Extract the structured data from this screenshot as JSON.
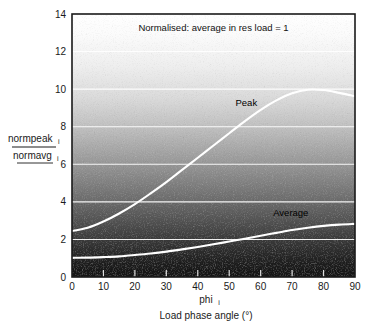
{
  "chart_data": {
    "type": "line",
    "title": "Normalised: average in res load = 1",
    "xlabel": "Load phase angle (°)",
    "xlabel_symbol": "phi",
    "xlabel_symbol_sub": "i",
    "ylabel_numerator": "normpeak",
    "ylabel_numerator_sub": "i",
    "ylabel_denominator": "normavg",
    "ylabel_denominator_sub": "i",
    "xlim": [
      0,
      90
    ],
    "ylim": [
      0,
      14
    ],
    "xticks": [
      "0",
      "10",
      "20",
      "30",
      "40",
      "50",
      "60",
      "70",
      "80",
      "90"
    ],
    "yticks": [
      "0",
      "2",
      "4",
      "6",
      "8",
      "10",
      "12",
      "14"
    ],
    "grid": "horizontal-white",
    "legend_position": "inline-annotation",
    "background": "vertical-grayscale-gradient-dark-bottom-light-top-with-noise",
    "x": [
      0,
      5,
      10,
      15,
      20,
      25,
      30,
      35,
      40,
      45,
      50,
      55,
      60,
      65,
      70,
      75,
      80,
      85,
      90
    ],
    "series": [
      {
        "name": "Peak",
        "annotation": "Peak",
        "values": [
          2.45,
          2.62,
          2.95,
          3.38,
          3.88,
          4.45,
          5.05,
          5.7,
          6.35,
          7.0,
          7.65,
          8.3,
          8.9,
          9.4,
          9.78,
          9.97,
          9.95,
          9.8,
          9.62
        ]
      },
      {
        "name": "Average",
        "annotation": "Average",
        "values": [
          1.02,
          1.03,
          1.06,
          1.1,
          1.17,
          1.25,
          1.35,
          1.47,
          1.6,
          1.74,
          1.89,
          2.04,
          2.2,
          2.35,
          2.5,
          2.62,
          2.72,
          2.79,
          2.83
        ]
      }
    ],
    "annotations": [
      {
        "text": "Peak",
        "x": 52,
        "y": 9.1
      },
      {
        "text": "Average",
        "x": 64,
        "y": 3.25
      }
    ],
    "colors": {
      "curve": "#ffffff",
      "grid": "#ffffff",
      "frame": "#1a1a1a",
      "text": "#111111",
      "page_background": "#ffffff"
    }
  }
}
